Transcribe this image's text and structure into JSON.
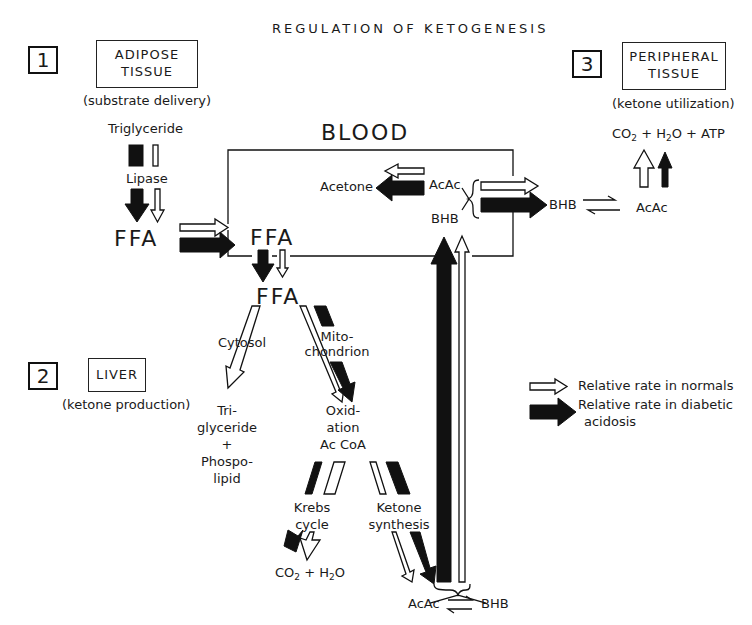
{
  "title": "REGULATION OF KETOGENESIS",
  "sections": [
    {
      "number": "1",
      "box": [
        "ADIPOSE",
        "TISSUE"
      ],
      "subtitle": "(substrate delivery)"
    },
    {
      "number": "2",
      "box": [
        "LIVER"
      ],
      "subtitle": "(ketone production)"
    },
    {
      "number": "3",
      "box": [
        "PERIPHERAL",
        "TISSUE"
      ],
      "subtitle": "(ketone utilization)"
    }
  ],
  "adipose": {
    "triglyceride": "Triglyceride",
    "lipase": "Lipase",
    "ffa": "FFA"
  },
  "blood": {
    "label": "BLOOD",
    "ffa": "FFA",
    "acetone": "Acetone",
    "acac": "AcAc",
    "bhb": "BHB"
  },
  "liver": {
    "ffa": "FFA",
    "cytosol": "Cytosol",
    "mito": [
      "Mito-",
      "chondrion"
    ],
    "tg": [
      "Tri-",
      "glyceride",
      "+",
      "Phospo-",
      "lipid"
    ],
    "oxidation": [
      "Oxid-",
      "ation",
      "Ac CoA"
    ],
    "krebs": [
      "Krebs",
      "cycle"
    ],
    "ketone_synthesis": [
      "Ketone",
      "synthesis"
    ],
    "co2_h2o": {
      "co": "CO",
      "two": "2",
      "plus_h": " + H",
      "two2": "2",
      "o": "O"
    },
    "acac": "AcAc",
    "bhb": "BHB"
  },
  "peripheral": {
    "products": {
      "co": "CO",
      "s1": "2",
      "mid": " + H",
      "s2": "2",
      "end": "O + ATP"
    },
    "bhb": "BHB",
    "acac": "AcAc"
  },
  "legend": [
    {
      "style": "open",
      "label": "Relative rate in normals"
    },
    {
      "style": "filled",
      "label_lines": [
        "Relative rate in diabetic",
        "acidosis"
      ]
    }
  ]
}
